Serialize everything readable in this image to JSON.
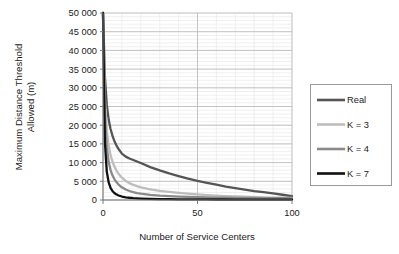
{
  "chart_data": {
    "type": "line",
    "title": "",
    "xlabel": "Number of Service Centers",
    "ylabel": "Maximum Distance Threshold Allowed (m)",
    "ylabel_line1": "Maximum Distance Threshold",
    "ylabel_line2": "Allowed (m)",
    "xlim": [
      0,
      100
    ],
    "ylim": [
      0,
      50000
    ],
    "xticks": [
      0,
      50,
      100
    ],
    "xtick_labels": [
      "0",
      "50",
      "100"
    ],
    "yticks": [
      0,
      5000,
      10000,
      15000,
      20000,
      25000,
      30000,
      35000,
      40000,
      45000,
      50000
    ],
    "ytick_labels": [
      "0",
      "5 000",
      "10 000",
      "15 000",
      "20 000",
      "25 000",
      "30 000",
      "35 000",
      "40 000",
      "45 000",
      "50 000"
    ],
    "grid": {
      "major_horizontal": true,
      "minor_horizontal": true,
      "minor_horizontal_step": 1000,
      "major_vertical": true,
      "minor_vertical": true,
      "minor_vertical_step": 10
    },
    "legend": {
      "position": "right",
      "border": true,
      "entries": [
        "Real",
        "K = 3",
        "K = 4",
        "K = 7"
      ]
    },
    "x": [
      0,
      1,
      2,
      3,
      4,
      5,
      6,
      7,
      8,
      9,
      10,
      12,
      14,
      16,
      18,
      20,
      25,
      30,
      35,
      40,
      45,
      50,
      55,
      60,
      65,
      70,
      75,
      80,
      85,
      90,
      95,
      100
    ],
    "series": [
      {
        "name": "Real",
        "color": "#555555",
        "width": 2.3,
        "values": [
          50000,
          33000,
          25500,
          21500,
          19000,
          17200,
          15800,
          14700,
          13800,
          13100,
          12400,
          11600,
          11100,
          10700,
          10300,
          9900,
          8800,
          7900,
          7100,
          6400,
          5700,
          5100,
          4600,
          4100,
          3600,
          3200,
          2800,
          2400,
          2100,
          1750,
          1400,
          1000
        ]
      },
      {
        "name": "K = 3",
        "color": "#bdbdbd",
        "width": 2.3,
        "values": [
          50000,
          27000,
          18500,
          14500,
          12000,
          10300,
          9000,
          8000,
          7200,
          6500,
          6000,
          5100,
          4500,
          4050,
          3700,
          3400,
          2850,
          2450,
          2150,
          1900,
          1700,
          1500,
          1330,
          1180,
          1060,
          960,
          870,
          790,
          720,
          660,
          600,
          550
        ]
      },
      {
        "name": "K = 4",
        "color": "#8a8a8a",
        "width": 2.3,
        "values": [
          50000,
          23000,
          14000,
          10200,
          8000,
          6600,
          5600,
          4850,
          4250,
          3800,
          3400,
          2800,
          2400,
          2100,
          1870,
          1680,
          1360,
          1160,
          1020,
          910,
          830,
          760,
          710,
          660,
          620,
          590,
          560,
          530,
          510,
          490,
          470,
          450
        ]
      },
      {
        "name": "K = 7",
        "color": "#111111",
        "width": 2.3,
        "values": [
          50000,
          15500,
          7600,
          4700,
          3250,
          2400,
          1880,
          1520,
          1270,
          1080,
          930,
          730,
          600,
          505,
          435,
          385,
          300,
          250,
          215,
          190,
          172,
          158,
          147,
          138,
          130,
          124,
          118,
          113,
          109,
          105,
          102,
          100
        ]
      }
    ]
  }
}
